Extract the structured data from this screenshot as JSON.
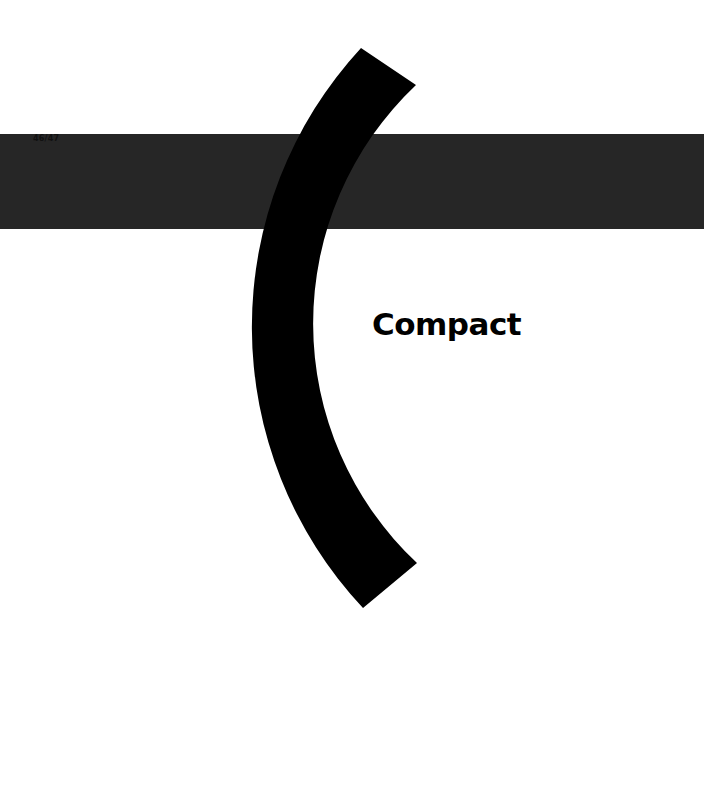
{
  "page": {
    "number": "46/47",
    "title": "Compact"
  },
  "colors": {
    "background": "#ffffff",
    "band": "#262626",
    "arc": "#000000",
    "title": "#000000"
  }
}
